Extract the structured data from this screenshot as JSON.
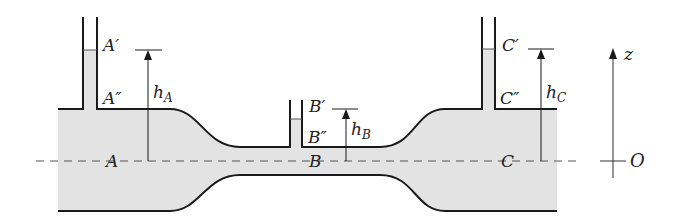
{
  "diagram": {
    "colors": {
      "fluid": "#e3e3e3",
      "wall": "#1a1a1a",
      "dash": "#555555",
      "arrow": "#1a1a1a"
    },
    "points": {
      "A": "A",
      "A_prime": "A′",
      "A_dprime": "A″",
      "B": "B",
      "B_prime": "B′",
      "B_dprime": "B″",
      "C": "C",
      "C_prime": "C′",
      "C_dprime": "C″",
      "O": "O"
    },
    "heights": {
      "hA": {
        "base": "h",
        "sub": "A"
      },
      "hB": {
        "base": "h",
        "sub": "B"
      },
      "hC": {
        "base": "h",
        "sub": "C"
      }
    },
    "axis": {
      "label": "z"
    }
  }
}
